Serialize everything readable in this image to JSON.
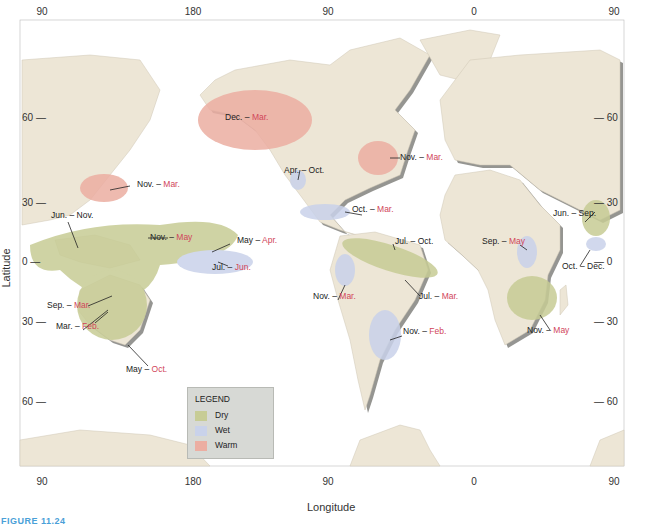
{
  "figure_label": "FIGURE 11.24",
  "axes": {
    "x_title": "Longitude",
    "y_title": "Latitude",
    "top_ticks": [
      {
        "label": "90",
        "x": 42
      },
      {
        "label": "180",
        "x": 193
      },
      {
        "label": "90",
        "x": 328
      },
      {
        "label": "0",
        "x": 474
      },
      {
        "label": "90",
        "x": 614
      }
    ],
    "bottom_ticks": [
      {
        "label": "90",
        "x": 42
      },
      {
        "label": "180",
        "x": 193
      },
      {
        "label": "90",
        "x": 328
      },
      {
        "label": "0",
        "x": 474
      },
      {
        "label": "90",
        "x": 614
      }
    ],
    "left_ticks": [
      {
        "label": "60 —",
        "y": 118
      },
      {
        "label": "30 —",
        "y": 203
      },
      {
        "label": "0 —",
        "y": 262
      },
      {
        "label": "30 —",
        "y": 322
      },
      {
        "label": "60 —",
        "y": 402
      }
    ],
    "right_ticks": [
      {
        "label": "— 60",
        "y": 118
      },
      {
        "label": "— 30",
        "y": 203
      },
      {
        "label": "— 0",
        "y": 262
      },
      {
        "label": "— 30",
        "y": 322
      },
      {
        "label": "— 60",
        "y": 402
      }
    ]
  },
  "colors": {
    "ocean": "#ffffff",
    "land": "#ede6d6",
    "land_shadow": "#8a8a86",
    "dry": "#c7cc95",
    "wet": "#c9d2ea",
    "warm": "#ecaea2",
    "highlight_text": "#d1455a",
    "figure_label": "#4aa0d8"
  },
  "legend": {
    "title": "LEGEND",
    "items": [
      {
        "label": "Dry",
        "color": "#c7cc95"
      },
      {
        "label": "Wet",
        "color": "#c9d2ea"
      },
      {
        "label": "Warm",
        "color": "#ecaea2"
      }
    ]
  },
  "regions": [
    {
      "type": "warm",
      "start": "Dec.",
      "end": "Mar.",
      "x": 225,
      "y": 117
    },
    {
      "type": "warm",
      "start": "Nov.",
      "end": "Mar.",
      "x": 400,
      "y": 157
    },
    {
      "type": "warm",
      "start": "Nov.",
      "end": "Mar.",
      "x": 137,
      "y": 184
    },
    {
      "type": "wet",
      "start": "Apr.",
      "end": "Oct.",
      "x": 284,
      "y": 170
    },
    {
      "type": "wet",
      "start": "Oct.",
      "end": "Mar.",
      "x": 352,
      "y": 209
    },
    {
      "type": "dry",
      "start": "Jun.",
      "end": "Sep.",
      "x": 553,
      "y": 213
    },
    {
      "type": "dry",
      "start": "Jun.",
      "end": "Nov.",
      "x": 51,
      "y": 215
    },
    {
      "type": "dry",
      "start": "Nov.",
      "end": "May",
      "x": 150,
      "y": 237
    },
    {
      "type": "dry",
      "start": "Jul.",
      "end": "Oct.",
      "x": 395,
      "y": 241
    },
    {
      "type": "dry",
      "start": "May",
      "end": "Apr.",
      "x": 237,
      "y": 240
    },
    {
      "type": "wet",
      "start": "Sep.",
      "end": "May",
      "x": 482,
      "y": 241
    },
    {
      "type": "wet",
      "start": "Jul.",
      "end": "Jun.",
      "x": 212,
      "y": 267
    },
    {
      "type": "wet",
      "start": "Oct.",
      "end": "Dec.",
      "x": 562,
      "y": 266
    },
    {
      "type": "wet",
      "start": "Nov.",
      "end": "Mar.",
      "x": 313,
      "y": 296
    },
    {
      "type": "dry",
      "start": "Jul.",
      "end": "Mar.",
      "x": 419,
      "y": 296
    },
    {
      "type": "dry",
      "start": "Sep.",
      "end": "Mar.",
      "x": 47,
      "y": 305
    },
    {
      "type": "wet",
      "start": "Nov.",
      "end": "Feb.",
      "x": 403,
      "y": 331
    },
    {
      "type": "dry",
      "start": "Nov.",
      "end": "May",
      "x": 527,
      "y": 330
    },
    {
      "type": "dry",
      "start": "Mar.",
      "end": "Feb.",
      "x": 56,
      "y": 326
    },
    {
      "type": "dry",
      "start": "May",
      "end": "Oct.",
      "x": 126,
      "y": 369
    }
  ]
}
